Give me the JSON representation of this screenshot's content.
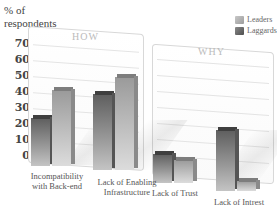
{
  "chart_data": {
    "type": "bar",
    "title": "",
    "ylabel": "% of respondents",
    "xlabel": "",
    "ylim": [
      0,
      70
    ],
    "yticks": [
      70,
      60,
      50,
      40,
      30,
      20,
      10,
      0
    ],
    "grid": true,
    "legend_position": "top-right",
    "panels": [
      {
        "title": "HOW",
        "categories": [
          "Incompatibility with Back-end",
          "Lack of Enabling Infrastructure"
        ]
      },
      {
        "title": "WHY",
        "categories": [
          "Lack of Trust",
          "Lack of Intrest"
        ]
      }
    ],
    "categories": [
      "Incompatibility with Back-end",
      "Lack of Enabling Infrastructure",
      "Lack of Trust",
      "Lack of Intrest"
    ],
    "series": [
      {
        "name": "Laggards",
        "color": "#7a7a7a",
        "values": [
          30,
          47,
          18,
          38
        ]
      },
      {
        "name": "Leaders",
        "color": "#b5b5b5",
        "values": [
          47,
          58,
          14,
          6
        ]
      }
    ]
  },
  "labels": {
    "ylabel_line1": "% of",
    "ylabel_line2": "respondents",
    "legend_leaders": "Leaders",
    "legend_laggards": "Laggards",
    "panel_how": "HOW",
    "panel_why": "WHY",
    "cat1_line1": "Incompatibility",
    "cat1_line2": "with Back-end",
    "cat2_line1": "Lack of Enabling",
    "cat2_line2": "Infrastructure",
    "cat3": "Lack of Trust",
    "cat4": "Lack of Intrest",
    "ticks": [
      "70",
      "60",
      "50",
      "40",
      "30",
      "20",
      "10",
      "0"
    ]
  }
}
